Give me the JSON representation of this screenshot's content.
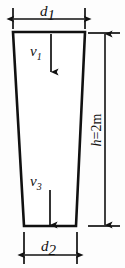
{
  "figure": {
    "type": "engineering-diagram",
    "background_color": "#fdfdfd",
    "line_color": "#111111"
  },
  "shape": {
    "name": "tapered-duct",
    "top_width_px": 72,
    "bottom_width_px": 53,
    "height_px": 194,
    "corners": {
      "top_left": [
        13,
        32
      ],
      "top_right": [
        85,
        32
      ],
      "bottom_right": [
        76,
        226
      ],
      "bottom_left": [
        24,
        226
      ]
    }
  },
  "dimensions": {
    "top": {
      "label": "d",
      "subscript": "1",
      "orientation": "horizontal",
      "y_px": 19,
      "x_start_px": 13,
      "x_end_px": 85
    },
    "bottom": {
      "label": "d",
      "subscript": "2",
      "orientation": "horizontal",
      "y_px": 255,
      "x_start_px": 24,
      "x_end_px": 77
    },
    "right": {
      "label": "h=2",
      "unit": "m",
      "full_text": "h=2m",
      "orientation": "vertical",
      "x_px": 105,
      "y_start_px": 33,
      "y_end_px": 226
    }
  },
  "velocity_arrows": [
    {
      "label": "v",
      "subscript": "1",
      "name": "velocity-v1",
      "x_px": 51,
      "y_start_px": 33,
      "y_end_px": 73,
      "label_x_px": 34,
      "label_y_px": 52,
      "direction": "down"
    },
    {
      "label": "v",
      "subscript": "3",
      "name": "velocity-v3",
      "x_px": 50,
      "y_start_px": 188,
      "y_end_px": 226,
      "label_x_px": 33,
      "label_y_px": 186,
      "direction": "down"
    }
  ]
}
